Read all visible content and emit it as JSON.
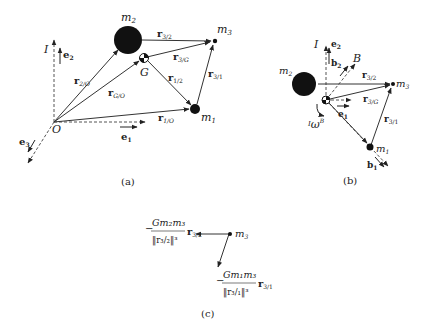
{
  "panels": {
    "a": {
      "caption": "(a)",
      "labels": {
        "m2": "m",
        "m2_sub": "2",
        "m3": "m",
        "m3_sub": "3",
        "m1": "m",
        "m1_sub": "1",
        "G": "G",
        "O": "O",
        "I": "I",
        "e1": "e",
        "e1_sub": "1",
        "e2": "e",
        "e2_sub": "2",
        "e3": "e",
        "e3_sub": "3",
        "r32": "r",
        "r32_sub": "3/2",
        "r3G": "r",
        "r3G_sub": "3/G",
        "r12": "r",
        "r12_sub": "1/2",
        "r31": "r",
        "r31_sub": "3/1",
        "r2O": "r",
        "r2O_sub": "2/O",
        "rGO": "r",
        "rGO_sub": "G/O",
        "r1O": "r",
        "r1O_sub": "1/O"
      }
    },
    "b": {
      "caption": "(b)",
      "labels": {
        "I": "I",
        "B": "B",
        "e1": "e",
        "e1_sub": "1",
        "e2": "e",
        "e2_sub": "2",
        "b1": "b",
        "b1_sub": "1",
        "b2": "b",
        "b2_sub": "2",
        "m2": "m",
        "m2_sub": "2",
        "m3": "m",
        "m3_sub": "3",
        "m1": "m",
        "m1_sub": "1",
        "r32": "r",
        "r32_sub": "3/2",
        "r3G": "r",
        "r3G_sub": "3/G",
        "r31": "r",
        "r31_sub": "3/1",
        "omega": "ω",
        "omega_pre": "I",
        "omega_sup": "B"
      }
    },
    "c": {
      "caption": "(c)",
      "labels": {
        "m3": "m",
        "m3_sub": "3",
        "f32_num": "Gm₂m₃",
        "f32_sign": "−",
        "f32_den": "‖r₃/₂‖³",
        "f32_vec": "r",
        "f32_vec_sub": "3/2",
        "f31_num": "Gm₁m₃",
        "f31_sign": "−",
        "f31_den": "‖r₃/₁‖³",
        "f31_vec": "r",
        "f31_vec_sub": "3/1"
      }
    }
  }
}
